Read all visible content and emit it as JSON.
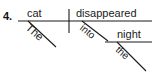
{
  "diagram": {
    "type": "reed-kellogg-sentence-diagram",
    "item_number": "4.",
    "sentence": "The cat disappeared into the night.",
    "ink_color": "#1a1a1a",
    "background_color": "#ffffff",
    "words": {
      "subject": "cat",
      "subject_article": "The",
      "verb": "disappeared",
      "preposition": "into",
      "object_of_preposition": "night",
      "object_article": "the"
    },
    "lines": {
      "baseline": {
        "x1": 18,
        "y1": 21,
        "x2": 152,
        "y2": 21
      },
      "subject_predicate_divider": {
        "x1": 69,
        "y1": 9,
        "x2": 69,
        "y2": 33
      },
      "article_1_slant": {
        "x1": 28,
        "y1": 21,
        "x2": 56,
        "y2": 47
      },
      "preposition_slant": {
        "x1": 82,
        "y1": 21,
        "x2": 108,
        "y2": 41
      },
      "object_baseline": {
        "x1": 105,
        "y1": 42,
        "x2": 152,
        "y2": 42
      },
      "article_2_slant": {
        "x1": 117,
        "y1": 42,
        "x2": 146,
        "y2": 71
      }
    }
  }
}
